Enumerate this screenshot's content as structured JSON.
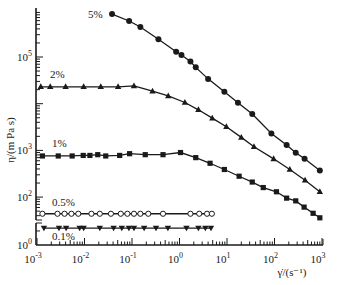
{
  "chart_data": {
    "type": "line",
    "title": "",
    "xlabel": "γ̇/(s⁻¹)",
    "ylabel": "η/(m Pa s)",
    "xscale": "log",
    "yscale": "log",
    "xlim": [
      0.001,
      1000
    ],
    "ylim": [
      1,
      1000000
    ],
    "y_axis_break": "between 10^0 and ~30",
    "grid": false,
    "x_ticks": [
      {
        "value": 0.001,
        "label": "10",
        "exp": "-3"
      },
      {
        "value": 0.01,
        "label": "10",
        "exp": "-2"
      },
      {
        "value": 0.1,
        "label": "10",
        "exp": "-1"
      },
      {
        "value": 1,
        "label": "10",
        "exp": "0"
      },
      {
        "value": 10,
        "label": "10",
        "exp": "1"
      },
      {
        "value": 100,
        "label": "10",
        "exp": "2"
      },
      {
        "value": 1000,
        "label": "10",
        "exp": "3"
      }
    ],
    "y_ticks": [
      {
        "value": 1,
        "label": "10",
        "exp": "0"
      },
      {
        "value": 100,
        "label": "10",
        "exp": "2"
      },
      {
        "value": 1000,
        "label": "10",
        "exp": "3"
      },
      {
        "value": 10000,
        "label": "",
        "exp": ""
      },
      {
        "value": 100000,
        "label": "10",
        "exp": "5"
      }
    ],
    "series": [
      {
        "name": "5%",
        "marker": "filled-circle",
        "x": [
          0.038,
          0.087,
          0.15,
          0.36,
          0.85,
          1.1,
          1.7,
          2.2,
          4.0,
          8.8,
          17,
          34,
          86,
          180,
          280,
          430,
          900
        ],
        "y": [
          830000,
          590000,
          440000,
          240000,
          130000,
          110000,
          80000,
          60000,
          34000,
          18000,
          10500,
          6000,
          2300,
          1300,
          890,
          660,
          370
        ]
      },
      {
        "name": "2%",
        "marker": "filled-triangle-up",
        "x": [
          0.0012,
          0.0019,
          0.004,
          0.0096,
          0.022,
          0.051,
          0.11,
          0.27,
          0.58,
          1.3,
          2.5,
          4.9,
          9.7,
          20,
          37,
          96,
          210,
          440,
          900
        ],
        "y": [
          23000,
          23000,
          23000,
          23000,
          23000,
          23000,
          24000,
          18500,
          14700,
          10600,
          7400,
          4900,
          3200,
          1900,
          1200,
          660,
          390,
          230,
          130
        ]
      },
      {
        "name": "1%",
        "marker": "filled-square",
        "x": [
          0.0013,
          0.0028,
          0.0055,
          0.0094,
          0.013,
          0.019,
          0.028,
          0.055,
          0.089,
          0.19,
          0.45,
          1.05,
          2.2,
          4.4,
          8.8,
          18,
          34,
          58,
          110,
          180,
          280,
          420,
          650,
          900
        ],
        "y": [
          760,
          760,
          760,
          780,
          780,
          810,
          760,
          780,
          850,
          810,
          810,
          900,
          700,
          530,
          390,
          280,
          210,
          160,
          130,
          95,
          83,
          61,
          45,
          36
        ]
      },
      {
        "name": "0.5%",
        "marker": "open-circle",
        "x": [
          0.0013,
          0.0027,
          0.0038,
          0.0053,
          0.0074,
          0.014,
          0.021,
          0.036,
          0.058,
          0.08,
          0.11,
          0.15,
          0.22,
          0.45,
          1.7,
          2.6,
          3.8,
          4.8
        ],
        "y": [
          44,
          44,
          44,
          44,
          44,
          44,
          44,
          44,
          44,
          44,
          44,
          44,
          44,
          44,
          44,
          44,
          44,
          44
        ]
      },
      {
        "name": "0.1%",
        "marker": "filled-triangle-down",
        "x": [
          0.0014,
          0.0029,
          0.0041,
          0.0079,
          0.0096,
          0.021,
          0.041,
          0.061,
          0.086,
          0.11,
          0.18,
          0.32,
          0.57,
          1.4,
          2.5,
          3.5,
          4.6
        ],
        "y": [
          2.3,
          2.3,
          2.3,
          2.3,
          2.3,
          2.3,
          2.3,
          2.3,
          2.3,
          2.3,
          2.3,
          2.3,
          2.3,
          2.3,
          2.3,
          2.3,
          2.3
        ]
      }
    ],
    "annotations": [
      "5%",
      "2%",
      "1%",
      "0.5%",
      "0.1%"
    ]
  }
}
